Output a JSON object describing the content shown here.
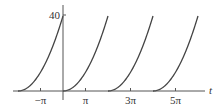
{
  "chart_data": {
    "type": "line",
    "title": "",
    "xlabel": "t",
    "ylabel": "",
    "xlim": [
      -6.9,
      6.5
    ],
    "ylim": [
      0,
      45
    ],
    "x_ticks": [
      {
        "value": -3.14159,
        "label": "−π"
      },
      {
        "value": 3.14159,
        "label": "π"
      },
      {
        "value": 9.42478,
        "label": "3π"
      },
      {
        "value": 15.70796,
        "label": "5π"
      }
    ],
    "y_ticks": [
      {
        "value": 40,
        "label": "40"
      }
    ],
    "period": 6.28318,
    "series": [
      {
        "name": "f(t)",
        "formula": "(t mod 2π)^2",
        "segments": [
          {
            "start": -6.28318,
            "end": 0
          },
          {
            "start": 0,
            "end": 6.28318
          },
          {
            "start": 6.28318,
            "end": 12.56637
          },
          {
            "start": 12.56637,
            "end": 18.84956
          }
        ],
        "color": "#444444"
      }
    ],
    "grid": false,
    "legend": "none"
  }
}
